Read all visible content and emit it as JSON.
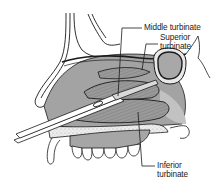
{
  "diagram": {
    "type": "anatomical-illustration",
    "colors": {
      "outline": "#1a1a1a",
      "tissue_fill": "#9a9a9a",
      "tissue_light": "#c8c8c8",
      "bone_fill": "#e6e6e6",
      "background": "#ffffff"
    },
    "labels": [
      {
        "id": "middle-turbinate",
        "text": "Middle turbinate",
        "lines": [
          "Middle turbinate"
        ]
      },
      {
        "id": "superior-turbinate",
        "text": "Superior turbinate",
        "lines": [
          "Superior",
          "turbinate"
        ]
      },
      {
        "id": "inferior-turbinate",
        "text": "Inferior turbinate",
        "lines": [
          "Inferior",
          "turbinate"
        ]
      }
    ],
    "instrument": "forceps"
  }
}
